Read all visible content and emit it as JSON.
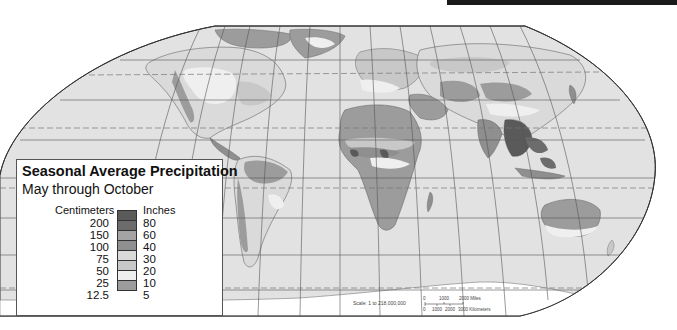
{
  "map": {
    "title": "Seasonal Average Precipitation",
    "subtitle": "May through October",
    "projection": "Robinson (world)",
    "colors": {
      "ocean": "#e2e2e2",
      "outline": "#333333",
      "graticule": "#555555",
      "tropic_dash": "#777777",
      "antarctica": "#ffffff"
    }
  },
  "legend": {
    "cm_header": "Centimeters",
    "in_header": "Inches",
    "classes": [
      {
        "cm": "200",
        "in": "80",
        "color": "#5a5a5a"
      },
      {
        "cm": "150",
        "in": "60",
        "color": "#6c6c6c"
      },
      {
        "cm": "100",
        "in": "40",
        "color": "#a4a4a4"
      },
      {
        "cm": "75",
        "in": "30",
        "color": "#8f8f8f"
      },
      {
        "cm": "50",
        "in": "20",
        "color": "#dadada"
      },
      {
        "cm": "25",
        "in": "10",
        "color": "#c8c8c8"
      },
      {
        "cm": "12.5",
        "in": "5",
        "color": "#efefef"
      },
      {
        "cm": "",
        "in": "",
        "color": "#9c9c9c"
      }
    ]
  },
  "scale": {
    "text": "Scale: 1 to 218,000,000",
    "miles_ticks": [
      "0",
      "1000",
      "2000 Miles"
    ],
    "km_ticks": [
      "0",
      "1000",
      "2000",
      "3000 Kilometers"
    ]
  }
}
